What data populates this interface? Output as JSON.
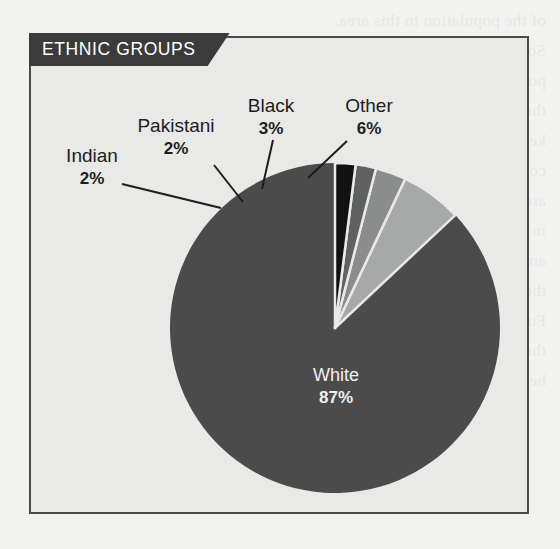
{
  "page": {
    "background_color": "#f2f2f0",
    "bleed_text": "of the population in this area.\nSome commentary on the local\npopulation and its make up over\nthe past ten years of record\nkeeping in this region of the\ncountry and the surrounding\nareas which have been studied\nin detail by the council team\nand their local partners across\nthe wider district boundaries.\nFurther notes are printed below\nthe table and the chart shown\nhere for additional reference."
  },
  "chart_panel": {
    "title": "ETHNIC GROUPS",
    "banner_color": "#3b3b3b",
    "banner_text_color": "#ffffff",
    "panel_color": "#e9e9e7",
    "border_color": "#4a4a4a"
  },
  "chart_data": {
    "type": "pie",
    "title": "ETHNIC GROUPS",
    "xlabel": "",
    "ylabel": "",
    "legend_position": "none",
    "grid": false,
    "total": 100,
    "units": "%",
    "start_angle_deg": 0,
    "direction": "counterclockwise",
    "categories": [
      "White",
      "Other",
      "Black",
      "Pakistani",
      "Indian"
    ],
    "values": [
      87,
      6,
      3,
      2,
      2
    ],
    "slices": [
      {
        "label": "White",
        "value": 87,
        "value_text": "87%",
        "color": "#4b4b4b",
        "label_placement": "inside",
        "label_color": "#f0f0f0"
      },
      {
        "label": "Other",
        "value": 6,
        "value_text": "6%",
        "color": "#a7a9a8",
        "label_placement": "callout",
        "label_color": "#1d1d1d"
      },
      {
        "label": "Black",
        "value": 3,
        "value_text": "3%",
        "color": "#8b8d8d",
        "label_placement": "callout",
        "label_color": "#1d1d1d"
      },
      {
        "label": "Pakistani",
        "value": 2,
        "value_text": "2%",
        "color": "#5e6062",
        "label_placement": "callout",
        "label_color": "#1d1d1d"
      },
      {
        "label": "Indian",
        "value": 2,
        "value_text": "2%",
        "color": "#111111",
        "label_placement": "callout",
        "label_color": "#1d1d1d"
      }
    ],
    "slice_separator_color": "#e9e9e7",
    "geometry": {
      "center_x": 335,
      "center_y": 328,
      "radius": 165
    }
  }
}
